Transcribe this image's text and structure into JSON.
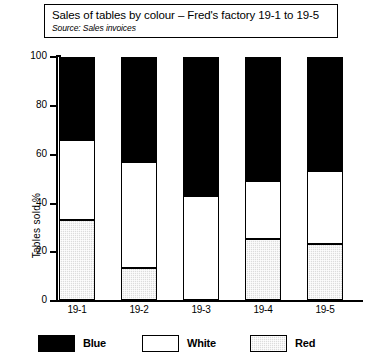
{
  "title": {
    "main": "Sales of tables by colour – Fred's factory 19-1 to 19-5",
    "source": "Source: Sales invoices"
  },
  "axes": {
    "y_title": "Tables sold  %",
    "y_ticks": [
      "100",
      "80",
      "60",
      "40",
      "20",
      "0"
    ]
  },
  "legend": {
    "items": [
      {
        "label": "Blue",
        "swatch": "black-swatch-icon"
      },
      {
        "label": "White",
        "swatch": "white-swatch-icon"
      },
      {
        "label": "Red",
        "swatch": "hatched-grey-swatch-icon"
      }
    ]
  },
  "chart_data": {
    "type": "bar",
    "stacked": true,
    "title": "Sales of tables by colour – Fred's factory 19-1 to 19-5",
    "subtitle": "Source: Sales invoices",
    "xlabel": "",
    "ylabel": "Tables sold  %",
    "ylim": [
      0,
      100
    ],
    "ytick_step": 20,
    "grid": false,
    "legend_position": "bottom",
    "categories": [
      "19-1",
      "19-2",
      "19-3",
      "19-4",
      "19-5"
    ],
    "series": [
      {
        "name": "Red",
        "color": "#dcdcdc",
        "values": [
          33,
          13,
          0,
          25,
          23
        ]
      },
      {
        "name": "White",
        "color": "#ffffff",
        "values": [
          33,
          44,
          43,
          24,
          30
        ]
      },
      {
        "name": "Blue",
        "color": "#000000",
        "values": [
          34,
          43,
          57,
          51,
          47
        ]
      }
    ],
    "cumulative_tops": {
      "Red": [
        33,
        13,
        0,
        25,
        23
      ],
      "White": [
        66,
        57,
        43,
        49,
        53
      ],
      "Blue": [
        100,
        100,
        100,
        100,
        100
      ]
    }
  },
  "colors": {
    "blue_series": "#000000",
    "white_series": "#ffffff",
    "red_series": "#dcdcdc",
    "axis": "#000000"
  }
}
